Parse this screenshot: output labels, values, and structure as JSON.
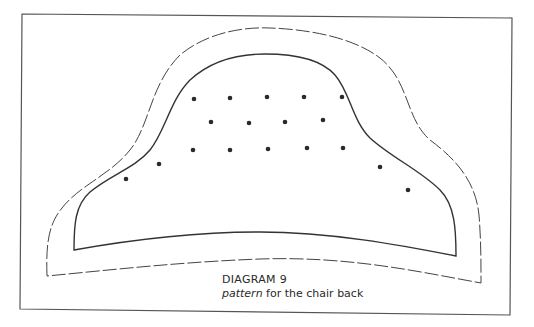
{
  "diagram": {
    "title": "DIAGRAM 9",
    "subtitle_italic": "pattern",
    "subtitle_rest": " for the chair back",
    "line_color": "#333333",
    "dot_color": "#2a2a2a",
    "outlines": [
      {
        "name": "cutting-line",
        "style": "dashed"
      },
      {
        "name": "seam-line",
        "style": "solid"
      }
    ],
    "tuft_dot_rows": [
      {
        "row": 1,
        "count": 5
      },
      {
        "row": 2,
        "count": 4
      },
      {
        "row": 3,
        "count": 5
      },
      {
        "row": "side-left",
        "count": 2
      },
      {
        "row": "side-right",
        "count": 2
      }
    ],
    "tuft_dot_total": 18
  }
}
